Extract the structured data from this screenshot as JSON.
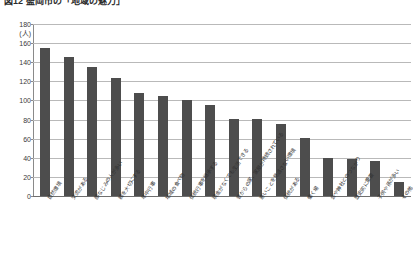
{
  "title": "図12 盛岡市の「地域の魅力」",
  "chart_data": {
    "type": "bar",
    "title": "図12 盛岡市の「地域の魅力」",
    "xlabel": "",
    "ylabel": "(人)",
    "unit_label": "(人)",
    "ylim": [
      0,
      180
    ],
    "ytick_step": 20,
    "yticks": [
      "180",
      "160",
      "140",
      "120",
      "100",
      "80",
      "60",
      "40",
      "20",
      "0"
    ],
    "grid": true,
    "legend": "none",
    "bar_color": "#4d4d4d",
    "categories": [
      "自然環境",
      "交流がある",
      "顔なじみの人が多い",
      "親を大切にする",
      "年中行事",
      "地域の食べ物",
      "伝統行事を継承する",
      "現金がなくても生活できる",
      "昔からの家、家屋が持続されている",
      "悪いことを見逃さない環境",
      "伝統がある",
      "働く場",
      "会や神社とのつながり",
      "歴史的に重要",
      "子供や孫が多い",
      "その他"
    ],
    "values": [
      155,
      145,
      135,
      123,
      108,
      105,
      101,
      95,
      81,
      81,
      75,
      61,
      40,
      39,
      37,
      15
    ]
  }
}
